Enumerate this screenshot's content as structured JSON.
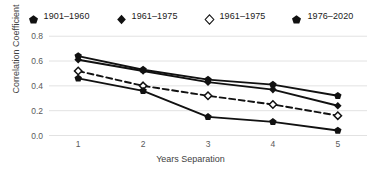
{
  "chart_data": {
    "type": "line",
    "title": "",
    "xlabel": "Years Separation",
    "ylabel": "Correlation Coefficient",
    "x": [
      1,
      2,
      3,
      4,
      5
    ],
    "xticklabels": [
      "1",
      "2",
      "3",
      "4",
      "5"
    ],
    "yticklabels": [
      "0.0",
      "0.2",
      "0.4",
      "0.6",
      "0.8"
    ],
    "yticks": [
      0.0,
      0.2,
      0.4,
      0.6,
      0.8
    ],
    "xlim": [
      0.55,
      5.45
    ],
    "ylim": [
      -0.02,
      0.85
    ],
    "grid": "horizontal",
    "legend_position": "top",
    "series": [
      {
        "name": "1901-1960",
        "values": [
          0.64,
          0.53,
          0.45,
          0.41,
          0.32
        ],
        "marker": "pentagon-filled",
        "linestyle": "solid",
        "color": "#111111"
      },
      {
        "name": "1961-1975",
        "values": [
          0.61,
          0.52,
          0.43,
          0.37,
          0.24
        ],
        "marker": "diamond-filled",
        "linestyle": "solid",
        "color": "#111111"
      },
      {
        "name": "1961-1975",
        "values": [
          0.52,
          0.4,
          0.32,
          0.25,
          0.16
        ],
        "marker": "diamond-hollow",
        "linestyle": "dashed",
        "color": "#111111"
      },
      {
        "name": "1976-2020",
        "values": [
          0.46,
          0.36,
          0.15,
          0.11,
          0.04
        ],
        "marker": "pentagon-filled",
        "linestyle": "solid",
        "color": "#111111"
      }
    ]
  },
  "legend": {
    "items": [
      {
        "label": "1901–1960",
        "marker": "pentagon-filled-icon"
      },
      {
        "label": "1961–1975",
        "marker": "diamond-filled-icon"
      },
      {
        "label": "1961–1975",
        "marker": "diamond-hollow-icon"
      },
      {
        "label": "1976–2020",
        "marker": "pentagon-filled-icon"
      }
    ]
  },
  "axes": {
    "y_title": "Correlation Coefficient",
    "x_title": "Years Separation"
  }
}
